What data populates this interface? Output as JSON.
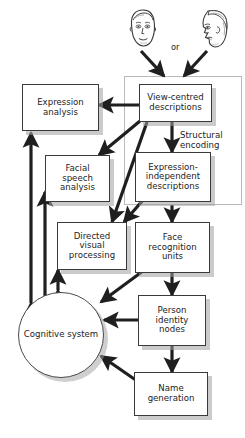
{
  "diagram": {
    "type": "flowchart",
    "or_label": "or",
    "group": {
      "label_line1": "Structural",
      "label_line2": "encoding",
      "name": "structural-encoding-group"
    },
    "inputs": [
      {
        "name": "frontal-face-icon",
        "view": "front"
      },
      {
        "name": "profile-face-icon",
        "view": "profile"
      }
    ],
    "nodes": [
      {
        "id": "expression-analysis",
        "lines": [
          "Expression",
          "analysis"
        ],
        "shape": "box"
      },
      {
        "id": "view-centred-descriptions",
        "lines": [
          "View-centred",
          "descriptions"
        ],
        "shape": "box"
      },
      {
        "id": "facial-speech-analysis",
        "lines": [
          "Facial",
          "speech",
          "analysis"
        ],
        "shape": "box"
      },
      {
        "id": "expression-independent-descriptions",
        "lines": [
          "Expression-",
          "independent",
          "descriptions"
        ],
        "shape": "box"
      },
      {
        "id": "directed-visual-processing",
        "lines": [
          "Directed",
          "visual",
          "processing"
        ],
        "shape": "box"
      },
      {
        "id": "face-recognition-units",
        "lines": [
          "Face",
          "recognition",
          "units"
        ],
        "shape": "box"
      },
      {
        "id": "cognitive-system",
        "lines": [
          "Cognitive",
          "system"
        ],
        "shape": "circle"
      },
      {
        "id": "person-identity-nodes",
        "lines": [
          "Person",
          "identity",
          "nodes"
        ],
        "shape": "box"
      },
      {
        "id": "name-generation",
        "lines": [
          "Name",
          "generation"
        ],
        "shape": "box"
      }
    ],
    "edges": [
      {
        "from": "frontal-face-icon",
        "to": "view-centred-descriptions",
        "style": "single"
      },
      {
        "from": "profile-face-icon",
        "to": "view-centred-descriptions",
        "style": "single"
      },
      {
        "from": "view-centred-descriptions",
        "to": "expression-analysis",
        "style": "single"
      },
      {
        "from": "view-centred-descriptions",
        "to": "facial-speech-analysis",
        "style": "single"
      },
      {
        "from": "view-centred-descriptions",
        "to": "directed-visual-processing",
        "style": "single"
      },
      {
        "from": "view-centred-descriptions",
        "to": "expression-independent-descriptions",
        "style": "single"
      },
      {
        "from": "expression-independent-descriptions",
        "to": "directed-visual-processing",
        "style": "single"
      },
      {
        "from": "expression-independent-descriptions",
        "to": "face-recognition-units",
        "style": "single"
      },
      {
        "from": "face-recognition-units",
        "to": "cognitive-system",
        "style": "single"
      },
      {
        "from": "face-recognition-units",
        "to": "person-identity-nodes",
        "style": "double"
      },
      {
        "from": "person-identity-nodes",
        "to": "cognitive-system",
        "style": "double"
      },
      {
        "from": "person-identity-nodes",
        "to": "name-generation",
        "style": "double"
      },
      {
        "from": "name-generation",
        "to": "cognitive-system",
        "style": "single"
      },
      {
        "from": "cognitive-system",
        "to": "expression-analysis",
        "style": "double"
      },
      {
        "from": "cognitive-system",
        "to": "facial-speech-analysis",
        "style": "double"
      },
      {
        "from": "cognitive-system",
        "to": "directed-visual-processing",
        "style": "double"
      }
    ],
    "colors": {
      "background": "#ffffff",
      "box_border": "#3a3a3a",
      "box_fill": "#ffffff",
      "shadow": "#a0a0a0",
      "group_border": "#b9b9b9",
      "arrow": "#1f1f1f",
      "text": "#232323"
    }
  }
}
